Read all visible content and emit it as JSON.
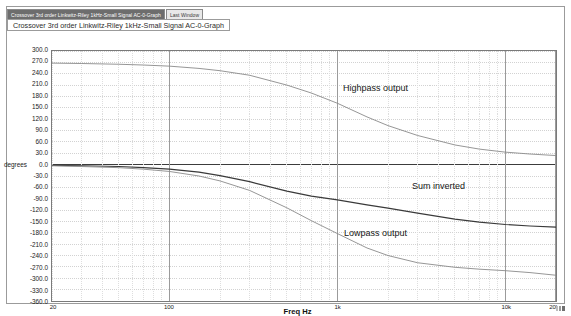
{
  "window": {
    "tabs": [
      {
        "label": "Crossover 3rd order Linkwitz-Riley 1kHz-Small Signal AC-0-Graph",
        "active": true
      },
      {
        "label": "Last Window",
        "active": false
      }
    ],
    "panel_title": "Crossover 3rd order Linkwitz-Riley 1kHz-Small Signal AC-0-Graph"
  },
  "chart_data": {
    "type": "line",
    "title": "Crossover 3rd order Linkwitz-Riley 1kHz-Small Signal AC-0-Graph",
    "xlabel": "Freq Hz",
    "ylabel": "degrees",
    "xscale": "log",
    "xlim": [
      20,
      20000
    ],
    "ylim": [
      -360,
      300
    ],
    "grid": true,
    "legend": "inline-annotations",
    "y_ticks": [
      "300.0",
      "270.0",
      "240.0",
      "210.0",
      "180.0",
      "150.0",
      "120.0",
      "90.0",
      "60.0",
      "30.0",
      "0.0",
      "-30.0",
      "-60.0",
      "-90.0",
      "-120.0",
      "-150.0",
      "-180.0",
      "-210.0",
      "-240.0",
      "-270.0",
      "-300.0",
      "-330.0",
      "-360.0"
    ],
    "y_tick_values": [
      300,
      270,
      240,
      210,
      180,
      150,
      120,
      90,
      60,
      30,
      0,
      -30,
      -60,
      -90,
      -120,
      -150,
      -180,
      -210,
      -240,
      -270,
      -300,
      -330,
      -360
    ],
    "x_ticks": [
      {
        "label": "20",
        "value": 20
      },
      {
        "label": "100",
        "value": 100
      },
      {
        "label": "1k",
        "value": 1000
      },
      {
        "label": "10k",
        "value": 10000
      },
      {
        "label": "20k",
        "value": 20000
      }
    ],
    "series": [
      {
        "name": "Highpass output",
        "color": "#8a8a8a",
        "annotation": "Highpass output",
        "x": [
          20,
          30,
          50,
          70,
          100,
          150,
          200,
          300,
          500,
          700,
          1000,
          1500,
          2000,
          3000,
          5000,
          7000,
          10000,
          14000,
          20000
        ],
        "y": [
          268,
          267,
          265,
          263,
          260,
          254,
          248,
          236,
          210,
          189,
          162,
          126,
          103,
          77,
          52,
          41,
          33,
          28,
          24
        ]
      },
      {
        "name": "Sum inverted",
        "color": "#3a3a3a",
        "annotation": "Sum inverted",
        "x": [
          20,
          30,
          50,
          70,
          100,
          150,
          200,
          300,
          500,
          700,
          1000,
          1500,
          2000,
          3000,
          5000,
          7000,
          10000,
          14000,
          20000
        ],
        "y": [
          -2,
          -3,
          -5,
          -8,
          -12,
          -20,
          -29,
          -45,
          -70,
          -83,
          -93,
          -106,
          -115,
          -128,
          -144,
          -152,
          -158,
          -162,
          -165
        ]
      },
      {
        "name": "Lowpass output",
        "color": "#8a8a8a",
        "annotation": "Lowpass output",
        "x": [
          20,
          30,
          50,
          70,
          100,
          150,
          200,
          300,
          500,
          700,
          1000,
          1500,
          2000,
          3000,
          5000,
          7000,
          10000,
          14000,
          20000
        ],
        "y": [
          -3,
          -5,
          -8,
          -12,
          -18,
          -30,
          -43,
          -68,
          -114,
          -148,
          -182,
          -220,
          -240,
          -259,
          -271,
          -276,
          -280,
          -285,
          -292
        ]
      }
    ],
    "annotations": [
      {
        "text": "Highpass output",
        "x_px": 343,
        "y_px": 84
      },
      {
        "text": "Sum inverted",
        "x_px": 412,
        "y_px": 182
      },
      {
        "text": "Lowpass output",
        "x_px": 344,
        "y_px": 229
      }
    ]
  }
}
